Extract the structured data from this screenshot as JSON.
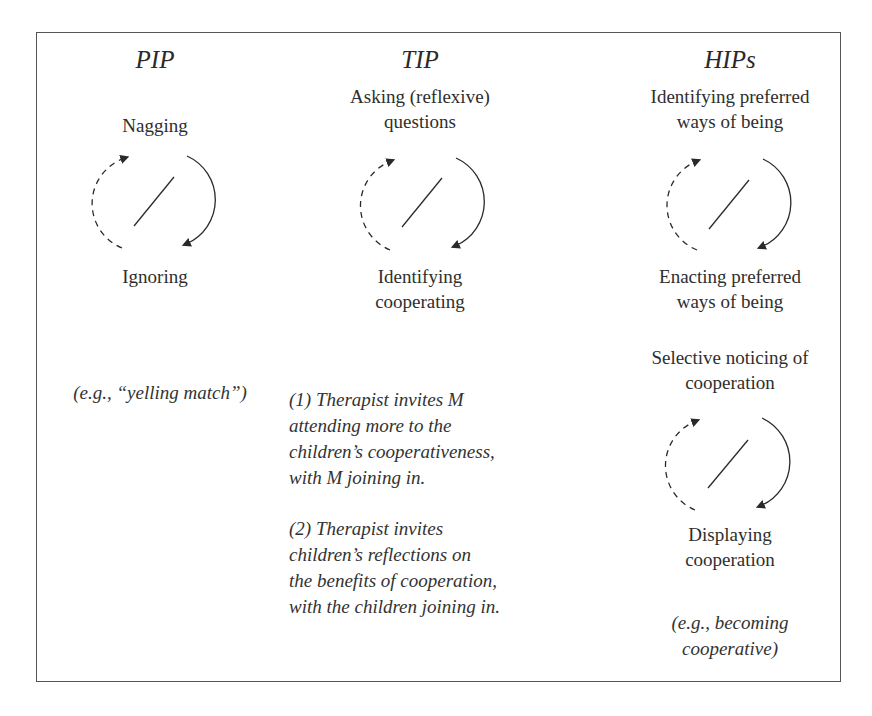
{
  "columns": [
    {
      "title": "PIP",
      "cycles": [
        {
          "top_label": [
            "Nagging"
          ],
          "bottom_label": [
            "Ignoring"
          ]
        }
      ],
      "example": "(e.g., “yelling match”)"
    },
    {
      "title": "TIP",
      "cycles": [
        {
          "top_label": [
            "Asking (reflexive)",
            "questions"
          ],
          "bottom_label": [
            "Identifying",
            "cooperating"
          ]
        }
      ],
      "paragraphs": [
        [
          "(1) Therapist invites M",
          "attending more to the",
          "children’s cooperativeness,",
          "with M joining in."
        ],
        [
          "(2) Therapist invites",
          "children’s reflections on",
          "the benefits of cooperation,",
          "with the children joining in."
        ]
      ]
    },
    {
      "title": "HIPs",
      "cycles": [
        {
          "top_label": [
            "Identifying preferred",
            "ways of being"
          ],
          "bottom_label": [
            "Enacting preferred",
            "ways of being"
          ]
        },
        {
          "top_label": [
            "Selective noticing of",
            "cooperation"
          ],
          "bottom_label": [
            "Displaying",
            "cooperation"
          ]
        }
      ],
      "example": [
        "(e.g., becoming",
        "cooperative)"
      ]
    }
  ],
  "legend": {
    "dashed_arrow": "return arc (upward, dashed)",
    "solid_arrow": "forward arc (downward, solid)",
    "slash": "mutual-invitation divider"
  },
  "colors": {
    "ink": "#2a2a2a",
    "frame": "#555555",
    "background": "#ffffff"
  }
}
